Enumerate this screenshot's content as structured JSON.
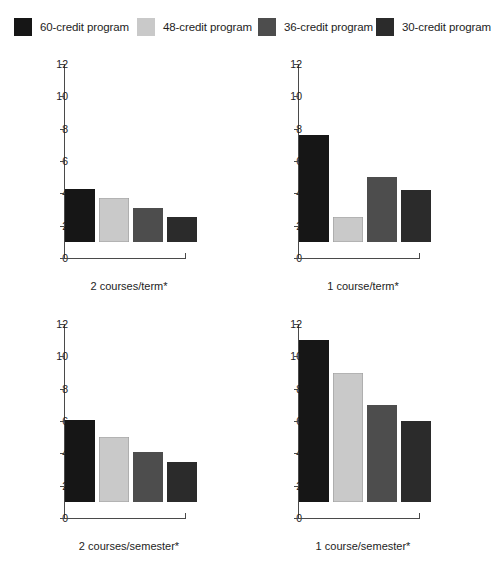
{
  "legend": {
    "entries": [
      {
        "label": "60-credit program",
        "color": "#161616",
        "x": 14
      },
      {
        "label": "48-credit program",
        "color": "#c9c9c9",
        "x": 137
      },
      {
        "label": "36-credit program",
        "color": "#4d4d4d",
        "x": 258
      },
      {
        "label": "30-credit program",
        "color": "#2b2b2b",
        "x": 376
      }
    ]
  },
  "chart_data": {
    "type": "bar",
    "title": "",
    "xlabel": "",
    "ylabel": "",
    "ylim": [
      0,
      12
    ],
    "yticks": [
      0,
      2,
      4,
      6,
      8,
      10,
      12
    ],
    "grid": false,
    "legend_position": "top",
    "categories": [
      "60-credit program",
      "48-credit program",
      "36-credit program",
      "30-credit program"
    ],
    "panels": [
      {
        "xlabel": "2 courses/term*",
        "values": [
          3.3,
          2.75,
          2.1,
          1.55
        ]
      },
      {
        "xlabel": "1 course/term*",
        "values": [
          6.6,
          1.55,
          4.05,
          3.2
        ]
      },
      {
        "xlabel": "2 courses/semester*",
        "values": [
          5.05,
          4.05,
          3.1,
          2.5
        ]
      },
      {
        "xlabel": "1 course/semester*",
        "values": [
          10.0,
          8.0,
          6.0,
          5.0
        ]
      }
    ],
    "series": [
      {
        "name": "60-credit program",
        "values": [
          3.3,
          6.6,
          5.05,
          10.0
        ]
      },
      {
        "name": "48-credit program",
        "values": [
          2.75,
          1.55,
          4.05,
          8.0
        ]
      },
      {
        "name": "36-credit program",
        "values": [
          2.1,
          4.05,
          3.1,
          6.0
        ]
      },
      {
        "name": "30-credit program",
        "values": [
          1.55,
          3.2,
          2.5,
          5.0
        ]
      }
    ]
  }
}
